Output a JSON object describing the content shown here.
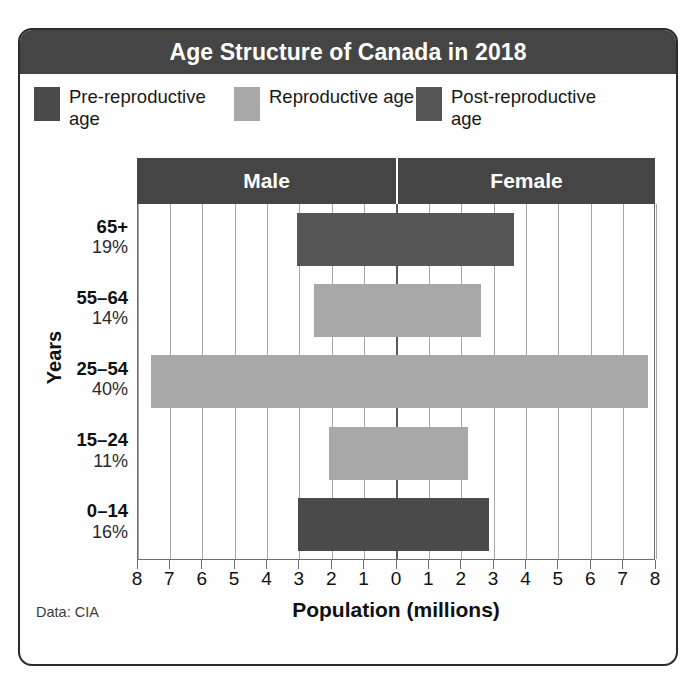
{
  "card": {
    "title": "Age Structure of Canada in 2018",
    "source_note": "Data: CIA"
  },
  "legend": {
    "items": [
      {
        "label": "Pre-reproductive age",
        "color": "#4a4a4a",
        "key": "pre"
      },
      {
        "label": "Reproductive age",
        "color": "#a8a8a8",
        "key": "repro"
      },
      {
        "label": "Post-reproductive age",
        "color": "#565656",
        "key": "post"
      }
    ]
  },
  "sex_headers": {
    "left": "Male",
    "right": "Female"
  },
  "axis": {
    "y_title": "Years",
    "x_title": "Population (millions)",
    "x_ticks": [
      "8",
      "7",
      "6",
      "5",
      "4",
      "3",
      "2",
      "1",
      "0",
      "1",
      "2",
      "3",
      "4",
      "5",
      "6",
      "7",
      "8"
    ]
  },
  "chart_data": {
    "type": "bar",
    "subtype": "population-pyramid",
    "title": "Age Structure of Canada in 2018",
    "xlabel": "Population (millions)",
    "ylabel": "Years",
    "xlim": [
      -8,
      8
    ],
    "x_tick_values": [
      8,
      7,
      6,
      5,
      4,
      3,
      2,
      1,
      0,
      1,
      2,
      3,
      4,
      5,
      6,
      7,
      8
    ],
    "grid": true,
    "legend_position": "top",
    "source": "Data: CIA",
    "categories": [
      "65+",
      "55–64",
      "25–54",
      "15–24",
      "0–14"
    ],
    "category_percents": [
      "19%",
      "14%",
      "40%",
      "11%",
      "16%"
    ],
    "category_groups": [
      "post",
      "repro",
      "repro",
      "repro",
      "pre"
    ],
    "series": [
      {
        "name": "Male",
        "side": "left",
        "values": [
          3.1,
          2.55,
          7.6,
          2.1,
          3.05
        ]
      },
      {
        "name": "Female",
        "side": "right",
        "values": [
          3.6,
          2.6,
          7.75,
          2.2,
          2.85
        ]
      }
    ],
    "rows": [
      {
        "age": "65+",
        "percent": "19%",
        "group": "post",
        "color": "#565656",
        "male": 3.1,
        "female": 3.6
      },
      {
        "age": "55–64",
        "percent": "14%",
        "group": "repro",
        "color": "#a8a8a8",
        "male": 2.55,
        "female": 2.6
      },
      {
        "age": "25–54",
        "percent": "40%",
        "group": "repro",
        "color": "#a8a8a8",
        "male": 7.6,
        "female": 7.75
      },
      {
        "age": "15–24",
        "percent": "11%",
        "group": "repro",
        "color": "#a8a8a8",
        "male": 2.1,
        "female": 2.2
      },
      {
        "age": "0–14",
        "percent": "16%",
        "group": "pre",
        "color": "#4a4a4a",
        "male": 3.05,
        "female": 2.85
      }
    ]
  }
}
